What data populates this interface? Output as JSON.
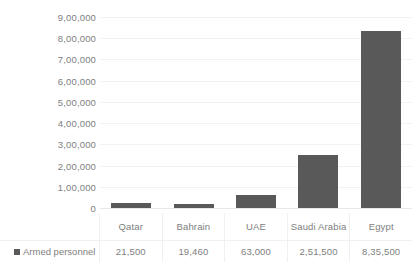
{
  "chart_data": {
    "type": "bar",
    "title": "",
    "xlabel": "",
    "ylabel": "",
    "categories": [
      "Qatar",
      "Bahrain",
      "UAE",
      "Saudi Arabia",
      "Egypt"
    ],
    "values": [
      21500,
      19460,
      63000,
      251500,
      835500
    ],
    "value_labels": [
      "21,500",
      "19,460",
      "63,000",
      "2,51,500",
      "8,35,500"
    ],
    "series": [
      {
        "name": "Armed personnel",
        "values": [
          21500,
          19460,
          63000,
          251500,
          835500
        ],
        "color": "#595959"
      }
    ],
    "ylim": [
      0,
      900000
    ],
    "ytick_values": [
      900000,
      800000,
      700000,
      600000,
      500000,
      400000,
      300000,
      200000,
      100000,
      0
    ],
    "ytick_labels": [
      "9,00,000",
      "8,00,000",
      "7,00,000",
      "6,00,000",
      "5,00,000",
      "4,00,000",
      "3,00,000",
      "2,00,000",
      "1,00,000",
      "0"
    ],
    "grid": true,
    "legend_position": "data-table-row-header",
    "data_table_visible": true,
    "number_format": "indian-lakh"
  },
  "legend": {
    "series_label": "Armed personnel",
    "marker_icon": "legend-square-icon",
    "marker_color": "#595959"
  },
  "colors": {
    "bar": "#595959",
    "text": "#808080",
    "gridline": "#f2f2f2",
    "table_border": "#f0f0f0",
    "background": "#ffffff"
  }
}
